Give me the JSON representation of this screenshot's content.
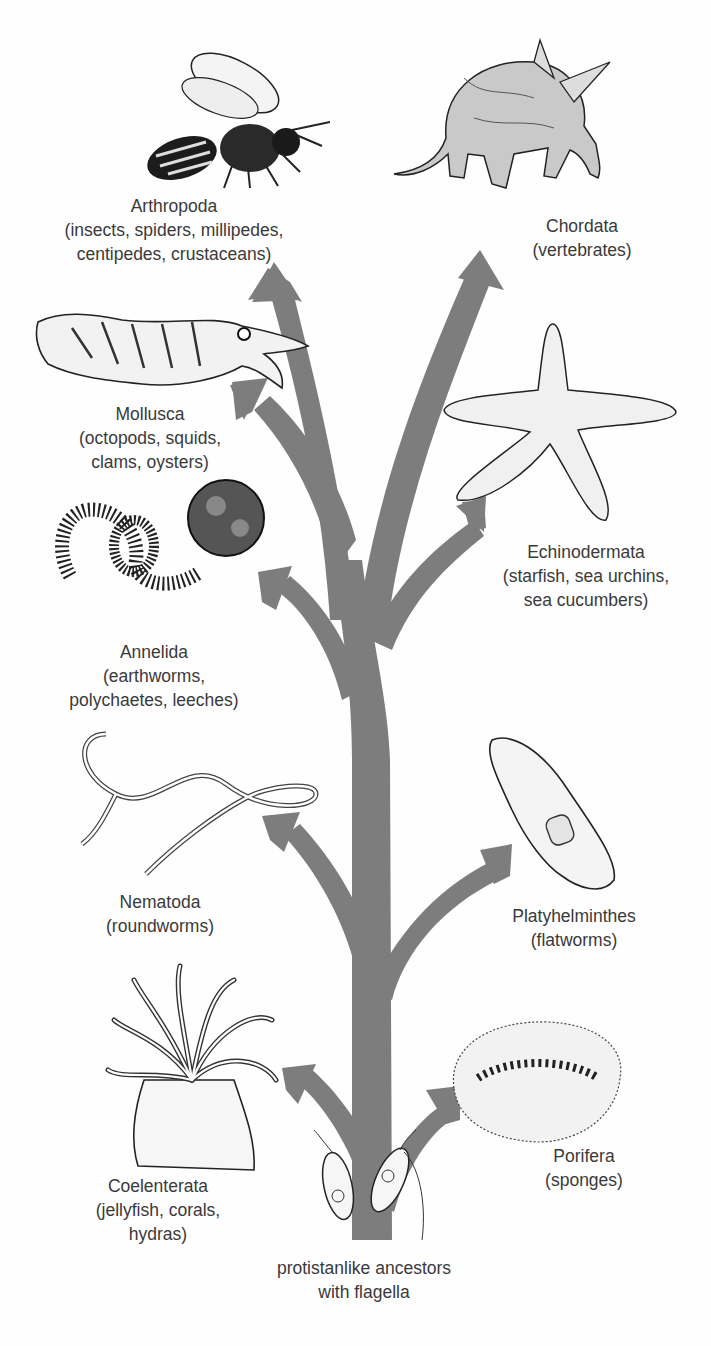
{
  "diagram": {
    "type": "phylogenetic-tree",
    "arrow_color": "#7d7d7d",
    "root": {
      "label_line1": "protistanlike ancestors",
      "label_line2": "with flagella"
    },
    "phyla": [
      {
        "id": "arthropoda",
        "name": "Arthropoda",
        "detail_line1": "(insects, spiders, millipedes,",
        "detail_line2": "centipedes, crustaceans)",
        "illustration": "bee"
      },
      {
        "id": "chordata",
        "name": "Chordata",
        "detail_line1": "(vertebrates)",
        "detail_line2": "",
        "illustration": "aardvark"
      },
      {
        "id": "mollusca",
        "name": "Mollusca",
        "detail_line1": "(octopods, squids,",
        "detail_line2": "clams, oysters)",
        "illustration": "cuttlefish"
      },
      {
        "id": "echinodermata",
        "name": "Echinodermata",
        "detail_line1": "(starfish, sea urchins,",
        "detail_line2": "sea cucumbers)",
        "illustration": "starfish"
      },
      {
        "id": "annelida",
        "name": "Annelida",
        "detail_line1": "(earthworms,",
        "detail_line2": "polychaetes, leeches)",
        "illustration": "polychaete-worm"
      },
      {
        "id": "nematoda",
        "name": "Nematoda",
        "detail_line1": "(roundworms)",
        "detail_line2": "",
        "illustration": "roundworm"
      },
      {
        "id": "platyhelminthes",
        "name": "Platyhelminthes",
        "detail_line1": "(flatworms)",
        "detail_line2": "",
        "illustration": "flatworm"
      },
      {
        "id": "coelenterata",
        "name": "Coelenterata",
        "detail_line1": "(jellyfish, corals,",
        "detail_line2": "hydras)",
        "illustration": "sea-anemone"
      },
      {
        "id": "porifera",
        "name": "Porifera",
        "detail_line1": "(sponges)",
        "detail_line2": "",
        "illustration": "sponge"
      }
    ]
  }
}
